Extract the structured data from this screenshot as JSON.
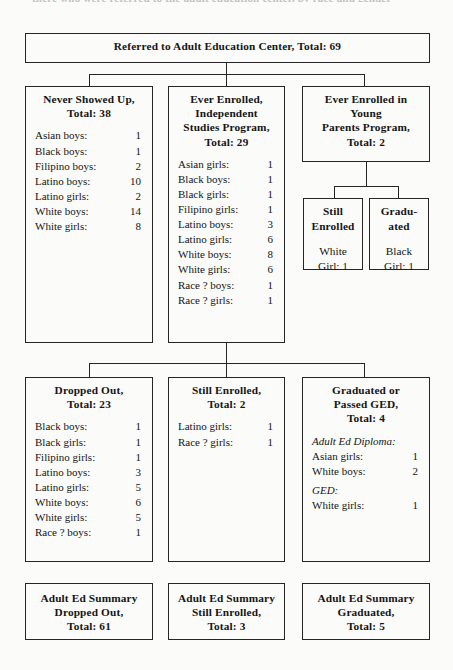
{
  "page": {
    "top_cut_text": "there who were referred to the adult education center, by race and gender"
  },
  "root": {
    "title": [
      "Referred to Adult Education Center, Total: 69"
    ]
  },
  "row1": [
    {
      "name": "never-showed-up",
      "title": [
        "Never Showed Up,",
        "Total: 38"
      ],
      "rows": [
        {
          "label": "Asian boys:",
          "value": "1"
        },
        {
          "label": "Black boys:",
          "value": "1"
        },
        {
          "label": "Filipino boys:",
          "value": "2"
        },
        {
          "label": "Latino boys:",
          "value": "10"
        },
        {
          "label": "Latino girls:",
          "value": "2"
        },
        {
          "label": "White boys:",
          "value": "14"
        },
        {
          "label": "White girls:",
          "value": "8"
        }
      ]
    },
    {
      "name": "ever-enrolled-independent-studies",
      "title": [
        "Ever Enrolled,",
        "Independent",
        "Studies Program,",
        "Total: 29"
      ],
      "rows": [
        {
          "label": "Asian girls:",
          "value": "1"
        },
        {
          "label": "Black boys:",
          "value": "1"
        },
        {
          "label": "Black girls:",
          "value": "1"
        },
        {
          "label": "Filipino girls:",
          "value": "1"
        },
        {
          "label": "Latino boys:",
          "value": "3"
        },
        {
          "label": "Latino girls:",
          "value": "6"
        },
        {
          "label": "White boys:",
          "value": "8"
        },
        {
          "label": "White girls:",
          "value": "6"
        },
        {
          "label": "Race ? boys:",
          "value": "1"
        },
        {
          "label": "Race ? girls:",
          "value": "1"
        }
      ]
    },
    {
      "name": "ever-enrolled-young-parents",
      "title": [
        "Ever Enrolled in",
        "Young",
        "Parents Program,",
        "Total: 2"
      ],
      "rows": []
    }
  ],
  "young_parents_children": [
    {
      "name": "young-parents-still-enrolled",
      "title": [
        "Still",
        "Enrolled"
      ],
      "detail": [
        "White",
        "Girl: 1"
      ]
    },
    {
      "name": "young-parents-graduated",
      "title": [
        "Gradu-",
        "ated"
      ],
      "detail": [
        "Black",
        "Girl: 1"
      ]
    }
  ],
  "row2": [
    {
      "name": "dropped-out",
      "title": [
        "Dropped Out,",
        "Total: 23"
      ],
      "rows": [
        {
          "label": "Black boys:",
          "value": "1"
        },
        {
          "label": "Black girls:",
          "value": "1"
        },
        {
          "label": "Filipino girls:",
          "value": "1"
        },
        {
          "label": "Latino boys:",
          "value": "3"
        },
        {
          "label": "Latino girls:",
          "value": "5"
        },
        {
          "label": "White boys:",
          "value": "6"
        },
        {
          "label": "White girls:",
          "value": "5"
        },
        {
          "label": "Race ? boys:",
          "value": "1"
        }
      ]
    },
    {
      "name": "still-enrolled",
      "title": [
        "Still Enrolled,",
        "Total: 2"
      ],
      "rows": [
        {
          "label": "Latino girls:",
          "value": "1"
        },
        {
          "label": "Race ? girls:",
          "value": "1"
        }
      ]
    },
    {
      "name": "graduated-or-passed-ged",
      "title": [
        "Graduated or",
        "Passed GED,",
        "Total: 4"
      ],
      "rows": [
        {
          "label": "Adult Ed Diploma:",
          "value": "",
          "subheading": true
        },
        {
          "label": "Asian girls:",
          "value": "1"
        },
        {
          "label": "White boys:",
          "value": "2"
        },
        {
          "label": "GED:",
          "value": "",
          "subheading": true
        },
        {
          "label": "White girls:",
          "value": "1"
        }
      ]
    }
  ],
  "summaries": [
    {
      "name": "summary-dropped-out",
      "title": [
        "Adult Ed Summary",
        "Dropped Out,",
        "Total: 61"
      ]
    },
    {
      "name": "summary-still-enrolled",
      "title": [
        "Adult Ed Summary",
        "Still Enrolled,",
        "Total: 3"
      ]
    },
    {
      "name": "summary-graduated",
      "title": [
        "Adult Ed Summary",
        "Graduated,",
        "Total: 5"
      ]
    }
  ]
}
